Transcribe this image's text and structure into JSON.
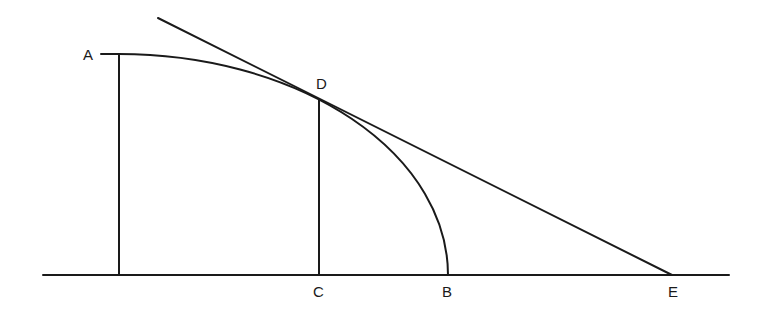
{
  "diagram": {
    "stroke_color": "#1a1a1a",
    "points": {
      "A": {
        "label": "A"
      },
      "B": {
        "label": "B"
      },
      "C": {
        "label": "C"
      },
      "D": {
        "label": "D"
      },
      "E": {
        "label": "E"
      }
    }
  }
}
